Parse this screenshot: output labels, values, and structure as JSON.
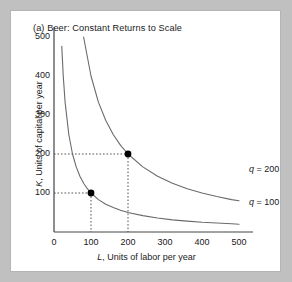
{
  "panel": {
    "title": "(a) Beer: Constant Returns to Scale"
  },
  "chart_data": {
    "type": "line",
    "title": "(a) Beer: Constant Returns to Scale",
    "xlabel": "L, Units of labor per year",
    "ylabel": "K, Units of capital per year",
    "xlabel_italic_prefix": "L",
    "xlabel_rest": ", Units of labor per year",
    "ylabel_italic_prefix": "K",
    "ylabel_rest": ", Units of capital per year",
    "xlim": [
      0,
      500
    ],
    "ylim": [
      0,
      500
    ],
    "xticks": [
      0,
      100,
      200,
      300,
      400,
      500
    ],
    "yticks": [
      100,
      200,
      300,
      400,
      500
    ],
    "xtick_labels": [
      "0",
      "100",
      "200",
      "300",
      "400",
      "500"
    ],
    "ytick_labels": [
      "100",
      "200",
      "300",
      "400",
      "500"
    ],
    "grid": false,
    "legend_position": "inline-right",
    "series": [
      {
        "name": "q = 100",
        "label": "q = 100",
        "label_italic_prefix": "q",
        "label_rest": " = 100",
        "isoquant_constant": 10000,
        "x": [
          21,
          25,
          30,
          40,
          50,
          60,
          70,
          80,
          90,
          100,
          120,
          140,
          160,
          180,
          200,
          240,
          280,
          320,
          360,
          400,
          440,
          480,
          500
        ],
        "y": [
          476,
          400,
          333,
          250,
          200,
          167,
          143,
          125,
          111,
          100,
          83,
          71,
          63,
          56,
          50,
          42,
          36,
          31,
          28,
          25,
          23,
          21,
          20
        ]
      },
      {
        "name": "q = 200",
        "label": "q = 200",
        "label_italic_prefix": "q",
        "label_rest": " = 200",
        "isoquant_constant": 40000,
        "x": [
          42,
          50,
          60,
          80,
          100,
          120,
          140,
          160,
          180,
          200,
          240,
          280,
          320,
          360,
          400,
          440,
          480,
          500
        ],
        "y": [
          952,
          800,
          667,
          500,
          400,
          333,
          286,
          250,
          222,
          200,
          167,
          143,
          125,
          111,
          100,
          91,
          83,
          80
        ]
      }
    ],
    "points": [
      {
        "name": "point-q100",
        "x": 100,
        "y": 100,
        "marker": "filled-circle",
        "guides": "dotted"
      },
      {
        "name": "point-q200",
        "x": 200,
        "y": 200,
        "marker": "filled-circle",
        "guides": "dotted"
      }
    ],
    "colors": {
      "curve": "#6b6b6b",
      "axis": "#444444",
      "marker": "#000000",
      "guide": "#555555",
      "text": "#1a1a1a",
      "panel_bg": "#ffffff",
      "page_bg": "#c0c0c0"
    }
  }
}
